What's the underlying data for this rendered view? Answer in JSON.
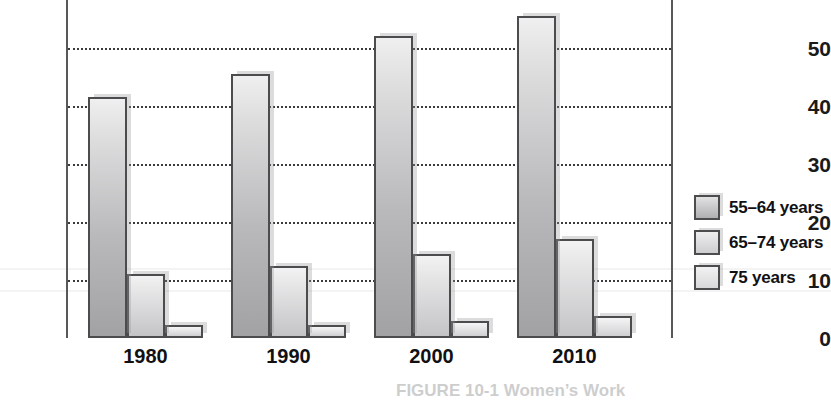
{
  "chart_data": {
    "type": "bar",
    "title": "",
    "xlabel": "",
    "ylabel": "",
    "categories": [
      "1980",
      "1990",
      "2000",
      "2010"
    ],
    "ylim": [
      0,
      58
    ],
    "yticks": [
      0,
      10,
      20,
      30,
      40,
      50
    ],
    "ytick_labels": [
      "0",
      "10",
      "20",
      "30",
      "40",
      "50"
    ],
    "grid": true,
    "grid_style": "dotted-horizontal",
    "legend_position": "right",
    "cropped_top": true,
    "series": [
      {
        "name": "55–64 years",
        "values": [
          41.5,
          45.5,
          52.0,
          55.5
        ],
        "color": "#b9b9bb"
      },
      {
        "name": "65–74 years",
        "values": [
          11.0,
          12.5,
          14.5,
          17.0
        ],
        "color": "#d2d2d4"
      },
      {
        "name": "75 years",
        "values": [
          2.2,
          2.2,
          3.0,
          3.8
        ],
        "color": "#dadadc"
      }
    ]
  },
  "legend": {
    "items": [
      {
        "label": "55–64 years"
      },
      {
        "label": "65–74 years"
      },
      {
        "label": "75 years"
      }
    ]
  },
  "caption": {
    "text": "FIGURE 10-1  Women’s Work"
  },
  "colors": {
    "axis": "#58585a",
    "gridline": "#3a3a3c",
    "bar_outline": "#4c4c4e",
    "text": "#111114",
    "background": "#ffffff"
  }
}
